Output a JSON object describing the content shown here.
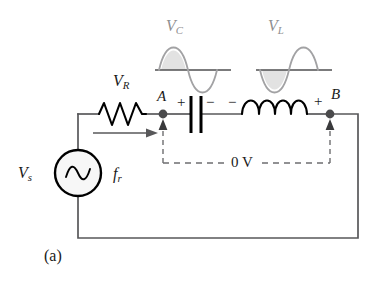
{
  "figure": {
    "label": "(a)",
    "caption_letter": "a"
  },
  "waveforms": [
    {
      "name": "capacitor-voltage-waveform",
      "label_main": "V",
      "label_sub": "C",
      "phase": "positive-first",
      "description": "sine starting with positive half cycle"
    },
    {
      "name": "inductor-voltage-waveform",
      "label_main": "V",
      "label_sub": "L",
      "phase": "negative-first",
      "description": "sine starting with negative half cycle"
    }
  ],
  "components": {
    "resistor": {
      "label_main": "V",
      "label_sub": "R",
      "type": "resistor"
    },
    "capacitor": {
      "type": "capacitor",
      "plus_sign": "+",
      "minus_sign": "−"
    },
    "inductor": {
      "type": "inductor",
      "plus_sign": "+",
      "minus_sign": "−"
    },
    "source": {
      "label_main": "V",
      "label_sub": "s",
      "frequency_main": "f",
      "frequency_sub": "r",
      "type": "ac-voltage-source"
    }
  },
  "nodes": [
    {
      "name": "node-a",
      "label": "A"
    },
    {
      "name": "node-b",
      "label": "B"
    }
  ],
  "measurement": {
    "name": "voltage-across-lc",
    "value": "0 V"
  },
  "colors": {
    "wire": "#58585a",
    "component": "#000000",
    "waveform_stroke": "#a2a2a4",
    "waveform_fill": "#e2e2e2",
    "dashed": "#6e6e70",
    "node": "#4a4a4c",
    "background": "#ffffff"
  }
}
